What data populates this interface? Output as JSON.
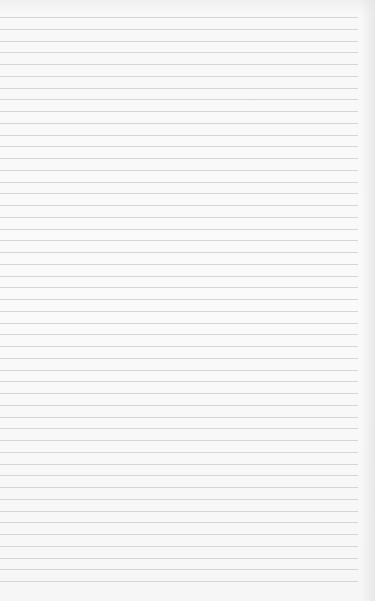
{
  "page": {
    "type": "blank-lined-paper",
    "line_count": 49,
    "first_line_y": 17,
    "line_spacing": 11.75,
    "line_color": "#d6d6d6",
    "background_color": "#f8f8f8"
  }
}
